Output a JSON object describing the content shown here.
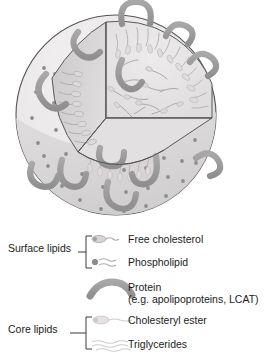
{
  "figure": {
    "colors": {
      "outline": "#4a4a4a",
      "surface_light": "#eceaea",
      "surface_shaded": "#d9d7d7",
      "wedge_wall": "#d3d1d1",
      "core_fill": "#e6e4e4",
      "protein": "#9a9a9a",
      "head_dot": "#8d8d8d",
      "tail": "#b3b3b3",
      "text": "#1b1b1b"
    },
    "particle": {
      "name": "lipoprotein-particle",
      "surface_head_dot_count": 38,
      "surface_protein_count": 9,
      "core_particle_count": 22,
      "monolayer_tail_count": 34
    }
  },
  "legend": {
    "groups": [
      {
        "name": "surface-lipids",
        "label": "Surface lipids",
        "connector": "short-dash",
        "items": [
          {
            "icon": "free-cholesterol-icon",
            "label": "Free cholesterol",
            "sublabel": ""
          },
          {
            "icon": "phospholipid-icon",
            "label": "Phospholipid",
            "sublabel": ""
          }
        ]
      },
      {
        "name": "protein-standalone",
        "label": "",
        "connector": "none",
        "items": [
          {
            "icon": "protein-icon",
            "label": "Protein",
            "sublabel": "(e.g. apolipoproteins, LCAT)"
          }
        ]
      },
      {
        "name": "core-lipids",
        "label": "Core lipids",
        "connector": "long-dash",
        "items": [
          {
            "icon": "cholesteryl-ester-icon",
            "label": "Cholesteryl ester",
            "sublabel": ""
          },
          {
            "icon": "triglycerides-icon",
            "label": "Triglycerides",
            "sublabel": ""
          }
        ]
      }
    ]
  }
}
